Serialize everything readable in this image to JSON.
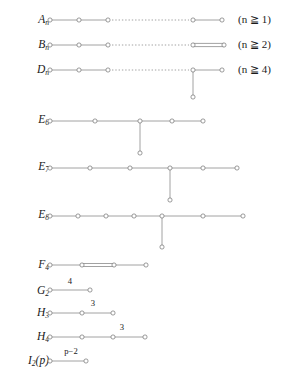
{
  "figure": {
    "title_visible": false,
    "background": "#ffffff",
    "line_color": "#8a8a8a",
    "node_fill": "#ffffff",
    "node_stroke": "#7a7a7a"
  },
  "rows": [
    {
      "id": "A_n",
      "label_base": "A",
      "label_sub": "n",
      "condition": "(n ≧ 1)",
      "condition_italic_part": "n",
      "condition_rest": " ≧ 1)",
      "has_dotted_gap": true,
      "node_count_text": "5 shown",
      "branch": "none",
      "special_edge": "none",
      "edge_label": ""
    },
    {
      "id": "B_n",
      "label_base": "B",
      "label_sub": "n",
      "condition": "(n ≧ 2)",
      "has_dotted_gap": true,
      "node_count_text": "5 shown",
      "branch": "none",
      "special_edge": "double-bond-last",
      "edge_label": ""
    },
    {
      "id": "D_n",
      "label_base": "D",
      "label_sub": "n",
      "condition": "(n ≧ 4)",
      "has_dotted_gap": true,
      "node_count_text": "5 shown",
      "branch": "down-from-node-4",
      "special_edge": "none",
      "edge_label": ""
    },
    {
      "id": "E_6",
      "label_base": "E",
      "label_sub": "6",
      "condition": "",
      "has_dotted_gap": false,
      "node_count_text": "5 in row + 1 branch",
      "branch": "down-from-node-3",
      "special_edge": "none",
      "edge_label": ""
    },
    {
      "id": "E_7",
      "label_base": "E",
      "label_sub": "7",
      "condition": "",
      "has_dotted_gap": false,
      "node_count_text": "6 in row + 1 branch",
      "branch": "down-from-node-4",
      "special_edge": "none",
      "edge_label": ""
    },
    {
      "id": "E_8",
      "label_base": "E",
      "label_sub": "8",
      "condition": "",
      "has_dotted_gap": false,
      "node_count_text": "7 in row + 1 branch",
      "branch": "down-from-node-5",
      "special_edge": "none",
      "edge_label": ""
    },
    {
      "id": "F_4",
      "label_base": "F",
      "label_sub": "4",
      "condition": "",
      "has_dotted_gap": false,
      "node_count_text": "4 shown",
      "branch": "none",
      "special_edge": "double-bond-middle",
      "edge_label": ""
    },
    {
      "id": "G_2",
      "label_base": "G",
      "label_sub": "2",
      "condition": "",
      "has_dotted_gap": false,
      "node_count_text": "2 shown",
      "branch": "none",
      "special_edge": "none",
      "edge_label": "4"
    },
    {
      "id": "H_3",
      "label_base": "H",
      "label_sub": "3",
      "condition": "",
      "has_dotted_gap": false,
      "node_count_text": "3 shown",
      "branch": "none",
      "special_edge": "none",
      "edge_label": "3"
    },
    {
      "id": "H_4",
      "label_base": "H",
      "label_sub": "4",
      "condition": "",
      "has_dotted_gap": false,
      "node_count_text": "4 shown",
      "branch": "none",
      "special_edge": "none",
      "edge_label": "3"
    },
    {
      "id": "I_2(p)",
      "label_base": "I",
      "label_sub": "2",
      "label_suffix": "(p)",
      "condition": "",
      "has_dotted_gap": false,
      "node_count_text": "2 shown",
      "branch": "none",
      "special_edge": "none",
      "edge_label": "p−2"
    }
  ],
  "labels": {
    "A": "A",
    "B": "B",
    "D": "D",
    "E": "E",
    "F": "F",
    "G": "G",
    "H": "H",
    "I": "I",
    "sub_n": "n",
    "sub_2": "2",
    "sub_3": "3",
    "sub_4": "4",
    "sub_6": "6",
    "sub_7": "7",
    "sub_8": "8",
    "suffix_p": "(p)"
  },
  "conditions": {
    "a_n": "(n ≧ 1)",
    "b_n": "(n ≧ 2)",
    "d_n": "(n ≧ 4)"
  },
  "edge_labels": {
    "g2": "4",
    "h3": "3",
    "h4": "3",
    "i2": "p−2"
  }
}
